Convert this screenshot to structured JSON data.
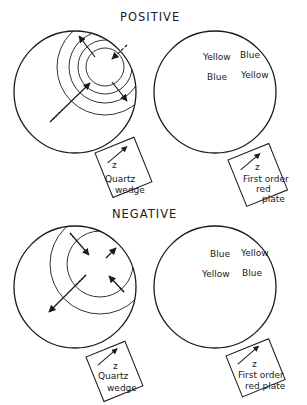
{
  "sections": [
    {
      "title": "POSITIVE",
      "left_panel": {
        "plate_axis": "z",
        "plate_label_lines": [
          "Quartz",
          "wedge"
        ]
      },
      "right_panel": {
        "quadrants": {
          "upper_left": "Yellow",
          "upper_right": "Blue",
          "lower_left": "Blue",
          "lower_right": "Yellow"
        },
        "plate_axis": "z",
        "plate_label_lines": [
          "First order",
          "red",
          "plate"
        ]
      }
    },
    {
      "title": "NEGATIVE",
      "left_panel": {
        "plate_axis": "z",
        "plate_label_lines": [
          "Quartz",
          "wedge"
        ]
      },
      "right_panel": {
        "quadrants": {
          "upper_left": "Blue",
          "upper_right": "Yellow",
          "lower_left": "Yellow",
          "lower_right": "Blue"
        },
        "plate_axis": "z",
        "plate_label_lines": [
          "First order",
          "red plate"
        ]
      }
    }
  ],
  "colors": {
    "ink": "#1a1a1a",
    "isogyre": "#6e6e6e",
    "background": "#ffffff"
  }
}
